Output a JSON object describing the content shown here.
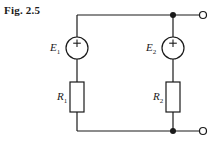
{
  "figure": {
    "label": "Fig. 2.5",
    "width": 220,
    "height": 145,
    "background_color": "#ffffff",
    "line_color": "#1a1a1a"
  },
  "components": {
    "source_1": {
      "name": "E",
      "subscript": "1",
      "polarity_mark": "+",
      "type": "voltage-source",
      "center_x": 77,
      "center_y": 48,
      "radius": 11
    },
    "source_2": {
      "name": "E",
      "subscript": "2",
      "polarity_mark": "+",
      "type": "voltage-source",
      "center_x": 173,
      "center_y": 48,
      "radius": 11
    },
    "resistor_1": {
      "name": "R",
      "subscript": "1",
      "type": "resistor",
      "x": 70,
      "y": 82,
      "width": 14,
      "height": 30
    },
    "resistor_2": {
      "name": "R",
      "subscript": "2",
      "type": "resistor",
      "x": 166,
      "y": 82,
      "width": 14,
      "height": 30
    }
  },
  "wires": {
    "top_rail": {
      "x1": 77,
      "y1": 15,
      "x2": 203,
      "y2": 15
    },
    "bottom_rail": {
      "x1": 77,
      "y1": 131,
      "x2": 203,
      "y2": 131
    },
    "left_branch_top": {
      "x1": 77,
      "y1": 15,
      "x2": 77,
      "y2": 37
    },
    "left_branch_mid": {
      "x1": 77,
      "y1": 59,
      "x2": 77,
      "y2": 82
    },
    "left_branch_bottom": {
      "x1": 77,
      "y1": 112,
      "x2": 77,
      "y2": 131
    },
    "right_branch_top": {
      "x1": 173,
      "y1": 15,
      "x2": 173,
      "y2": 37
    },
    "right_branch_mid": {
      "x1": 173,
      "y1": 59,
      "x2": 173,
      "y2": 82
    },
    "right_branch_bottom": {
      "x1": 173,
      "y1": 112,
      "x2": 173,
      "y2": 131
    }
  },
  "nodes": {
    "junction_top": {
      "x": 173,
      "y": 15,
      "radius": 3
    },
    "junction_bottom": {
      "x": 173,
      "y": 131,
      "radius": 3
    },
    "terminal_top": {
      "x": 203,
      "y": 15,
      "radius": 3.5
    },
    "terminal_bottom": {
      "x": 203,
      "y": 131,
      "radius": 3.5
    }
  }
}
